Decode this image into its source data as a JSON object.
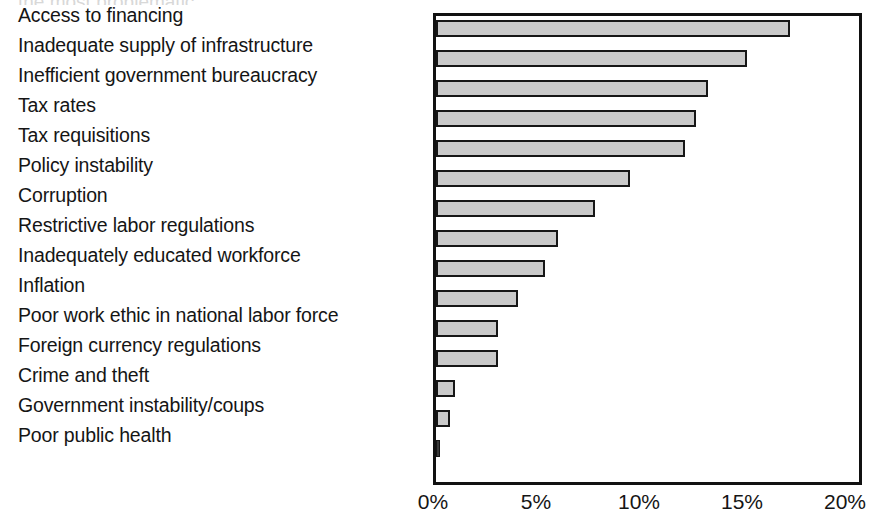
{
  "chart_data": {
    "type": "bar",
    "orientation": "horizontal",
    "title": "",
    "xlabel": "",
    "ylabel": "",
    "xlim": [
      0,
      20.8
    ],
    "grid": false,
    "legend": null,
    "tick_format": "percent",
    "xticks": [
      {
        "value": 0,
        "label": "0%"
      },
      {
        "value": 5,
        "label": "5%"
      },
      {
        "value": 10,
        "label": "10%"
      },
      {
        "value": 15,
        "label": "15%"
      },
      {
        "value": 20,
        "label": "20%"
      }
    ],
    "categories": [
      "Access to financing",
      "Inadequate supply of infrastructure",
      "Inefficient government bureaucracy",
      "Tax rates",
      "Tax requisitions",
      "Policy instability",
      "Corruption",
      "Restrictive labor regulations",
      "Inadequately educated workforce",
      "Inflation",
      "Poor work ethic in national labor force",
      "Foreign currency regulations",
      "Crime and theft",
      "Government instability/coups",
      "Poor public health"
    ],
    "values": [
      17.2,
      15.1,
      13.2,
      12.6,
      12.1,
      9.4,
      7.7,
      5.9,
      5.3,
      4.0,
      3.0,
      3.0,
      0.9,
      0.7,
      0.15
    ],
    "series": [
      {
        "name": "Share of responses",
        "values": [
          17.2,
          15.1,
          13.2,
          12.6,
          12.1,
          9.4,
          7.7,
          5.9,
          5.3,
          4.0,
          3.0,
          3.0,
          0.9,
          0.7,
          0.15
        ]
      }
    ],
    "colors": {
      "bar_fill": "#c9c9c9",
      "bar_border": "#161616",
      "axis": "#111111",
      "text": "#151515"
    }
  },
  "title_sliver": {
    "text": "the most problematic"
  }
}
